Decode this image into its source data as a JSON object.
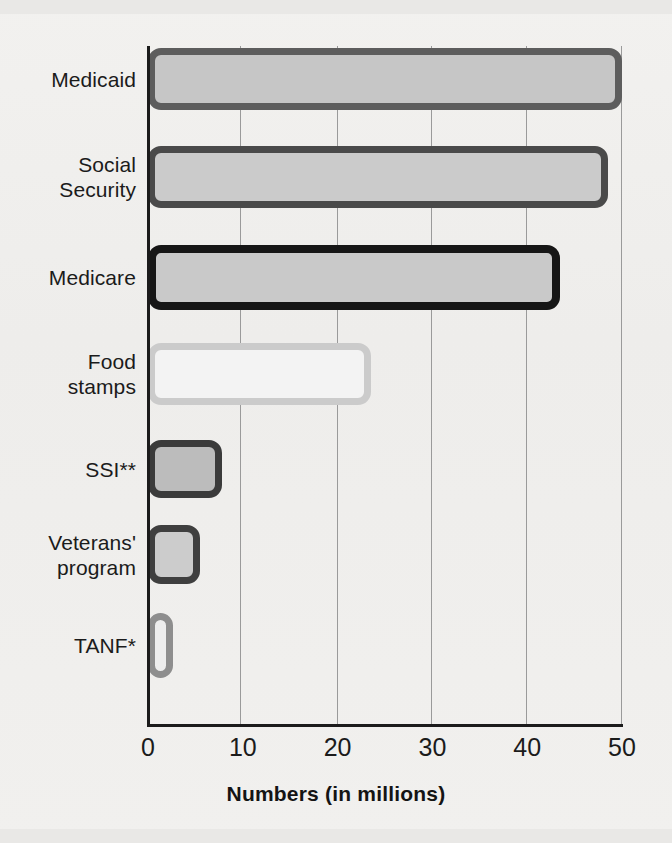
{
  "chart_data": {
    "type": "bar",
    "orientation": "horizontal",
    "title": "",
    "xlabel": "Numbers (in millions)",
    "ylabel": "",
    "xlim": [
      0,
      50
    ],
    "xticks": [
      "0",
      "10",
      "20",
      "30",
      "40",
      "50"
    ],
    "grid": "vertical",
    "legend": "none",
    "categories": [
      "Medicaid",
      "Social Security",
      "Medicare",
      "Food stamps",
      "SSI**",
      "Veterans' program",
      "TANF*"
    ],
    "values": [
      50,
      48.5,
      43.5,
      23.5,
      7.8,
      5.5,
      2.6
    ],
    "bars": [
      {
        "label_lines": [
          "Medicaid"
        ],
        "value": 50,
        "fill": "#c6c6c6",
        "stroke": "#5d5d5d"
      },
      {
        "label_lines": [
          "Social",
          "Security"
        ],
        "value": 48.5,
        "fill": "#cbcbcb",
        "stroke": "#4a4a4a"
      },
      {
        "label_lines": [
          "Medicare"
        ],
        "value": 43.5,
        "fill": "#c9c9c9",
        "stroke": "#161616"
      },
      {
        "label_lines": [
          "Food",
          "stamps"
        ],
        "value": 23.5,
        "fill": "#f3f3f3",
        "stroke": "#cbcbcb"
      },
      {
        "label_lines": [
          "SSI**"
        ],
        "value": 7.8,
        "fill": "#bcbcbc",
        "stroke": "#3b3b3b"
      },
      {
        "label_lines": [
          "Veterans'",
          "program"
        ],
        "value": 5.5,
        "fill": "#cccccc",
        "stroke": "#3f3f3f"
      },
      {
        "label_lines": [
          "TANF*"
        ],
        "value": 2.6,
        "fill": "#ededed",
        "stroke": "#8e8e8e"
      }
    ]
  },
  "colors": {
    "page_background": "#f0efed",
    "axis": "#1b1b1b",
    "gridline": "#9a9a9a",
    "text": "#1b1b1b"
  }
}
